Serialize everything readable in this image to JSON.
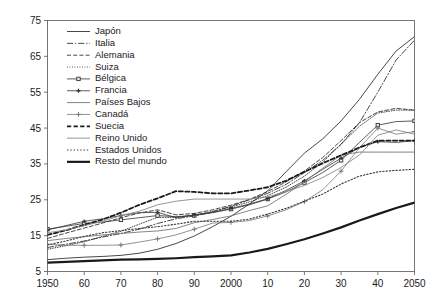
{
  "chart_data": {
    "type": "line",
    "title": "",
    "subtitle": "",
    "xlabel": "",
    "ylabel": "",
    "xlim": [
      1950,
      2050
    ],
    "ylim": [
      5,
      75
    ],
    "yticks": [
      5,
      15,
      25,
      35,
      45,
      55,
      65,
      75
    ],
    "ytick_labels": [
      "5",
      "15",
      "25",
      "35",
      "45",
      "55",
      "65",
      "75"
    ],
    "xticks": [
      1950,
      1960,
      1970,
      1980,
      1990,
      2000,
      2010,
      2020,
      2030,
      2040,
      2050
    ],
    "xtick_labels": [
      "1950",
      "60",
      "70",
      "80",
      "90",
      "2000",
      "10",
      "20",
      "30",
      "40",
      "2050"
    ],
    "grid": false,
    "legend_position": "upper-left-inside",
    "x": [
      1950,
      1955,
      1960,
      1965,
      1970,
      1975,
      1980,
      1985,
      1990,
      1995,
      2000,
      2005,
      2010,
      2015,
      2020,
      2025,
      2030,
      2035,
      2040,
      2045,
      2050
    ],
    "series": [
      {
        "name": "Japón",
        "style": "solid",
        "marker": "none",
        "color": "#333333",
        "width": 0.9,
        "values": [
          8.3,
          8.7,
          9.0,
          9.2,
          9.5,
          10.1,
          11.2,
          12.8,
          14.9,
          17.5,
          20.4,
          23.8,
          27.5,
          32.8,
          38.0,
          42.0,
          47.0,
          53.0,
          60.0,
          66.5,
          70.5
        ]
      },
      {
        "name": "Italia",
        "style": "dashdot",
        "marker": "none",
        "color": "#333333",
        "width": 0.9,
        "values": [
          11.7,
          12.6,
          13.5,
          14.6,
          15.6,
          16.8,
          18.4,
          19.7,
          20.5,
          21.6,
          23.2,
          25.0,
          26.8,
          29.3,
          32.6,
          36.0,
          40.5,
          46.5,
          55.0,
          64.0,
          69.5
        ]
      },
      {
        "name": "Alemania",
        "style": "dashed",
        "marker": "none",
        "color": "#333333",
        "width": 0.9,
        "values": [
          14.2,
          15.7,
          17.1,
          18.5,
          20.0,
          21.3,
          22.2,
          20.8,
          21.2,
          22.2,
          23.5,
          25.1,
          27.3,
          30.0,
          33.0,
          36.8,
          41.5,
          46.5,
          49.5,
          50.5,
          50.0
        ]
      },
      {
        "name": "Suiza",
        "style": "dotted-fine",
        "marker": "none",
        "color": "#333333",
        "width": 0.9,
        "values": [
          11.2,
          12.2,
          13.3,
          14.8,
          16.2,
          18.2,
          20.1,
          20.1,
          20.7,
          21.8,
          23.0,
          24.4,
          26.2,
          28.5,
          31.6,
          35.5,
          40.5,
          45.5,
          49.2,
          50.0,
          50.0
        ]
      },
      {
        "name": "Bélgica",
        "style": "solid",
        "marker": "square",
        "color": "#333333",
        "width": 0.8,
        "values": [
          16.8,
          17.6,
          18.4,
          18.8,
          19.4,
          20.0,
          20.6,
          20.3,
          20.6,
          21.4,
          22.4,
          23.6,
          25.2,
          27.2,
          29.8,
          32.6,
          36.0,
          41.0,
          45.8,
          46.8,
          47.0
        ]
      },
      {
        "name": "Francia",
        "style": "solid",
        "marker": "plus-fine",
        "color": "#333333",
        "width": 0.8,
        "values": [
          16.6,
          17.8,
          19.0,
          19.7,
          20.6,
          21.4,
          21.5,
          20.0,
          20.8,
          21.5,
          22.6,
          23.8,
          25.3,
          27.6,
          30.3,
          33.5,
          36.6,
          39.6,
          41.2,
          41.0,
          41.5
        ]
      },
      {
        "name": "Países Bajos",
        "style": "solid",
        "marker": "none",
        "color": "#777777",
        "width": 0.9,
        "values": [
          13.6,
          14.2,
          14.7,
          15.2,
          15.6,
          16.0,
          16.3,
          17.0,
          18.6,
          19.5,
          20.5,
          22.0,
          23.3,
          26.5,
          30.0,
          33.8,
          37.5,
          38.3,
          38.3,
          38.3,
          38.3
        ]
      },
      {
        "name": "Canadá",
        "style": "solid",
        "marker": "plus",
        "color": "#777777",
        "width": 0.8,
        "values": [
          12.6,
          12.3,
          12.3,
          12.3,
          12.4,
          13.2,
          14.1,
          15.2,
          16.8,
          18.5,
          18.7,
          19.2,
          20.5,
          22.2,
          24.5,
          27.8,
          33.0,
          39.5,
          45.0,
          43.3,
          44.0
        ]
      },
      {
        "name": "Suecia",
        "style": "dashed-bold",
        "marker": "none",
        "color": "#1a1a1a",
        "width": 1.8,
        "values": [
          15.2,
          16.5,
          18.0,
          19.5,
          21.4,
          23.6,
          25.4,
          27.4,
          27.2,
          26.8,
          26.8,
          27.6,
          28.5,
          30.3,
          32.8,
          35.2,
          37.4,
          39.6,
          41.5,
          41.5,
          41.5
        ]
      },
      {
        "name": "Reino Unido",
        "style": "solid",
        "marker": "none",
        "color": "#8a8a8a",
        "width": 0.9,
        "values": [
          15.8,
          16.6,
          17.8,
          19.0,
          20.6,
          21.8,
          23.6,
          24.6,
          25.2,
          25.2,
          25.2,
          25.2,
          25.8,
          27.3,
          29.0,
          31.2,
          34.0,
          37.5,
          43.0,
          44.5,
          43.3
        ]
      },
      {
        "name": "Estados Unidos",
        "style": "dotted",
        "marker": "none",
        "color": "#3a3a3a",
        "width": 1.1,
        "values": [
          12.4,
          13.5,
          14.8,
          15.8,
          16.4,
          17.0,
          17.5,
          18.2,
          19.0,
          19.0,
          19.0,
          19.6,
          21.0,
          22.6,
          24.6,
          26.6,
          29.4,
          31.6,
          32.8,
          33.2,
          33.5
        ]
      },
      {
        "name": "Resto del mundo",
        "style": "solid-bold",
        "marker": "none",
        "color": "#1a1a1a",
        "width": 2.2,
        "values": [
          7.5,
          7.7,
          7.9,
          8.1,
          8.3,
          8.4,
          8.5,
          8.7,
          9.0,
          9.2,
          9.5,
          10.3,
          11.3,
          12.6,
          14.0,
          15.6,
          17.3,
          19.2,
          21.0,
          22.7,
          24.2
        ]
      }
    ]
  },
  "legend": {
    "entries": [
      {
        "label": "Japón"
      },
      {
        "label": "Italia"
      },
      {
        "label": "Alemania"
      },
      {
        "label": "Suiza"
      },
      {
        "label": "Bélgica"
      },
      {
        "label": "Francia"
      },
      {
        "label": "Países Bajos"
      },
      {
        "label": "Canadá"
      },
      {
        "label": "Suecia"
      },
      {
        "label": "Reino Unido"
      },
      {
        "label": "Estados Unidos"
      },
      {
        "label": "Resto del mundo"
      }
    ]
  },
  "style": {
    "background": "#ffffff",
    "axis_color": "#555555",
    "text_color": "#1a1a1a"
  }
}
